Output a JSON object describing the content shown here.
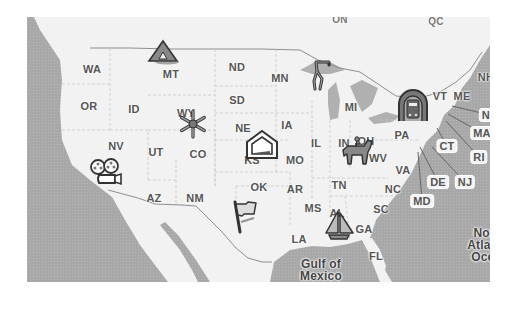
{
  "map": {
    "colors": {
      "land": "#f2f2f2",
      "water": "#a9a9a9",
      "lakes": "#b3b3b3",
      "border": "#9a9a9a",
      "label": "#555555"
    },
    "country_labels": [
      {
        "text": "ON",
        "x": 340,
        "y": 19
      },
      {
        "text": "QC",
        "x": 436,
        "y": 21
      }
    ],
    "state_labels": [
      {
        "text": "WA",
        "x": 92,
        "y": 69
      },
      {
        "text": "OR",
        "x": 89,
        "y": 106
      },
      {
        "text": "ID",
        "x": 134,
        "y": 109
      },
      {
        "text": "MT",
        "x": 171,
        "y": 74
      },
      {
        "text": "ND",
        "x": 237,
        "y": 67
      },
      {
        "text": "SD",
        "x": 237,
        "y": 100
      },
      {
        "text": "MN",
        "x": 280,
        "y": 78
      },
      {
        "text": "WY",
        "x": 186,
        "y": 113
      },
      {
        "text": "NE",
        "x": 243,
        "y": 128
      },
      {
        "text": "IA",
        "x": 287,
        "y": 125
      },
      {
        "text": "MI",
        "x": 351,
        "y": 107
      },
      {
        "text": "NV",
        "x": 116,
        "y": 146
      },
      {
        "text": "UT",
        "x": 156,
        "y": 152
      },
      {
        "text": "CO",
        "x": 198,
        "y": 154
      },
      {
        "text": "IL",
        "x": 316,
        "y": 143
      },
      {
        "text": "IN",
        "x": 344,
        "y": 143
      },
      {
        "text": "OH",
        "x": 366,
        "y": 141
      },
      {
        "text": "PA",
        "x": 402,
        "y": 135
      },
      {
        "text": "MO",
        "x": 295,
        "y": 160
      },
      {
        "text": "WV",
        "x": 378,
        "y": 158
      },
      {
        "text": "VA",
        "x": 403,
        "y": 170
      },
      {
        "text": "KS",
        "x": 252,
        "y": 160
      },
      {
        "text": "OK",
        "x": 259,
        "y": 187
      },
      {
        "text": "AR",
        "x": 295,
        "y": 189
      },
      {
        "text": "TN",
        "x": 339,
        "y": 185
      },
      {
        "text": "NC",
        "x": 393,
        "y": 189
      },
      {
        "text": "AZ",
        "x": 154,
        "y": 198
      },
      {
        "text": "NM",
        "x": 195,
        "y": 198
      },
      {
        "text": "MS",
        "x": 313,
        "y": 208
      },
      {
        "text": "AL",
        "x": 337,
        "y": 213
      },
      {
        "text": "SC",
        "x": 381,
        "y": 209
      },
      {
        "text": "GA",
        "x": 364,
        "y": 229
      },
      {
        "text": "LA",
        "x": 299,
        "y": 239
      },
      {
        "text": "FL",
        "x": 376,
        "y": 256
      },
      {
        "text": "ME",
        "x": 462,
        "y": 96
      },
      {
        "text": "VT",
        "x": 440,
        "y": 96
      },
      {
        "text": "NH",
        "x": 486,
        "y": 77
      }
    ],
    "callout_labels": [
      {
        "text": "MA",
        "x": 482,
        "y": 133,
        "lx": 448,
        "ly": 114
      },
      {
        "text": "RI",
        "x": 479,
        "y": 157,
        "lx": 446,
        "ly": 121
      },
      {
        "text": "CT",
        "x": 447,
        "y": 146,
        "lx": 437,
        "ly": 128
      },
      {
        "text": "NJ",
        "x": 465,
        "y": 182,
        "lx": 432,
        "ly": 147
      },
      {
        "text": "DE",
        "x": 438,
        "y": 182,
        "lx": 420,
        "ly": 147
      },
      {
        "text": "MD",
        "x": 422,
        "y": 201,
        "lx": 418,
        "ly": 152
      },
      {
        "text": "NH",
        "x": 490,
        "y": 115,
        "lx": 452,
        "ly": 106
      }
    ],
    "water_labels": [
      {
        "line1": "Gulf of",
        "line2": "Mexico",
        "x": 321,
        "y": 270
      },
      {
        "line1": "North",
        "line2": "Atlantic",
        "line3": "Ocean",
        "x": 490,
        "y": 245
      }
    ],
    "markers": [
      {
        "name": "camping-tent-marker",
        "icon": "tent-icon",
        "x": 163,
        "y": 52
      },
      {
        "name": "skiing-snowflake-marker",
        "icon": "snowflake-icon",
        "x": 193,
        "y": 124
      },
      {
        "name": "home-marker",
        "icon": "house-icon",
        "x": 262,
        "y": 145
      },
      {
        "name": "golf-marker",
        "icon": "golfer-icon",
        "x": 321,
        "y": 75
      },
      {
        "name": "train-marker",
        "icon": "train-icon",
        "x": 413,
        "y": 106
      },
      {
        "name": "horse-riding-marker",
        "icon": "horse-rider-icon",
        "x": 357,
        "y": 151
      },
      {
        "name": "film-camera-marker",
        "icon": "movie-camera-icon",
        "x": 107,
        "y": 172
      },
      {
        "name": "flag-marker",
        "icon": "flag-icon",
        "x": 246,
        "y": 217
      },
      {
        "name": "sailboat-marker",
        "icon": "sailboat-icon",
        "x": 339,
        "y": 225
      }
    ]
  }
}
